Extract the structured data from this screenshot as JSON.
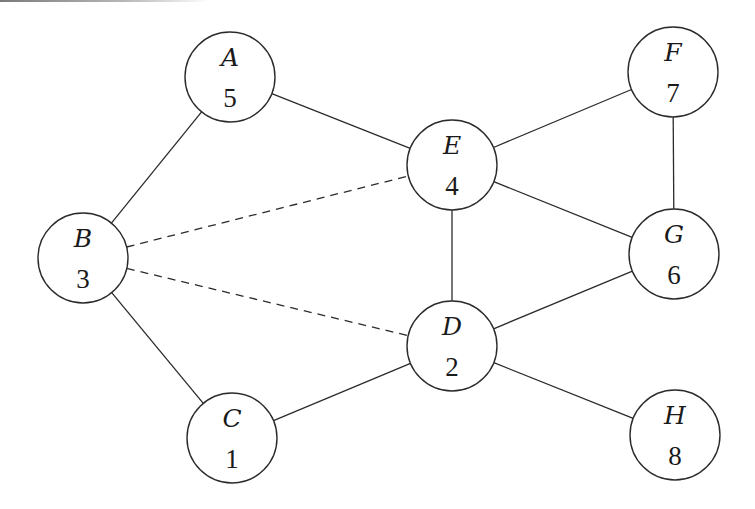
{
  "diagram": {
    "type": "weighted-graph",
    "node_radius": 45,
    "nodes": [
      {
        "id": "A",
        "label": "A",
        "value": "5",
        "x": 230,
        "y": 77
      },
      {
        "id": "B",
        "label": "B",
        "value": "3",
        "x": 83,
        "y": 258
      },
      {
        "id": "C",
        "label": "C",
        "value": "1",
        "x": 232,
        "y": 438
      },
      {
        "id": "D",
        "label": "D",
        "value": "2",
        "x": 452,
        "y": 346
      },
      {
        "id": "E",
        "label": "E",
        "value": "4",
        "x": 452,
        "y": 165
      },
      {
        "id": "F",
        "label": "F",
        "value": "7",
        "x": 673,
        "y": 72
      },
      {
        "id": "G",
        "label": "G",
        "value": "6",
        "x": 674,
        "y": 254
      },
      {
        "id": "H",
        "label": "H",
        "value": "8",
        "x": 675,
        "y": 435
      }
    ],
    "edges": [
      {
        "from": "A",
        "to": "B",
        "style": "solid"
      },
      {
        "from": "A",
        "to": "E",
        "style": "solid"
      },
      {
        "from": "B",
        "to": "C",
        "style": "solid"
      },
      {
        "from": "B",
        "to": "E",
        "style": "dashed"
      },
      {
        "from": "B",
        "to": "D",
        "style": "dashed"
      },
      {
        "from": "C",
        "to": "D",
        "style": "solid"
      },
      {
        "from": "E",
        "to": "D",
        "style": "solid"
      },
      {
        "from": "E",
        "to": "F",
        "style": "solid"
      },
      {
        "from": "E",
        "to": "G",
        "style": "solid"
      },
      {
        "from": "F",
        "to": "G",
        "style": "solid"
      },
      {
        "from": "D",
        "to": "G",
        "style": "solid"
      },
      {
        "from": "D",
        "to": "H",
        "style": "solid"
      }
    ],
    "colors": {
      "stroke": "#2b2b2b",
      "background": "#ffffff",
      "text": "#1a1a1a"
    }
  }
}
